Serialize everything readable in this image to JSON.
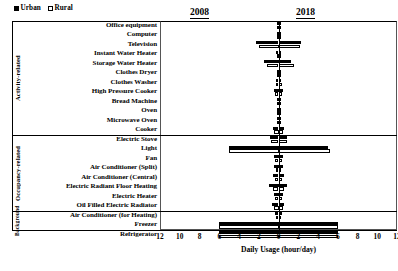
{
  "legend": {
    "items": [
      {
        "label": "Urban",
        "swatch": "filled-black",
        "color": "#000000"
      },
      {
        "label": "Rural",
        "swatch": "hollow-white",
        "color": "#ffffff"
      }
    ]
  },
  "headers": {
    "left_year": "2008",
    "right_year": "2018"
  },
  "groups": [
    {
      "name": "Activity-related",
      "rows": 12
    },
    {
      "name": "Occupancy-related",
      "rows": 8
    },
    {
      "name": "Background",
      "rows": 2
    }
  ],
  "axis": {
    "title": "Daily Usage (hour/day)",
    "ticks": [
      "12",
      "10",
      "8",
      "6",
      "4",
      "2",
      "0",
      "2",
      "4",
      "6",
      "8",
      "10",
      "12"
    ],
    "max": 12,
    "left_direction_year": "2008",
    "right_direction_year": "2018"
  },
  "chart_data": {
    "type": "bar",
    "title": "",
    "subtitle": "",
    "xlabel": "Daily Usage (hour/day)",
    "ylabel": "",
    "xlim": [
      -12,
      12
    ],
    "grid": false,
    "legend_position": "top-left",
    "orientation": "horizontal-diverging",
    "note": "Butterfly chart: left half shows 2008 values, right half shows 2018 values; each appliance has an Urban (filled) bar and a Rural (hollow) bar.",
    "categories": [
      "Office equipment",
      "Computer",
      "Television",
      "Instant Water Heater",
      "Storage Water Heater",
      "Clothes Dryer",
      "Clothes Washer",
      "High Pressure Cooker",
      "Bread Machine",
      "Oven",
      "Microwave Oven",
      "Cooker",
      "Electric Stove",
      "Light",
      "Fan",
      "Air Conditioner (Split)",
      "Air Conditioner (Central)",
      "Electric Radiant Floor Heating",
      "Electric Heater",
      "Oil Filled Electric Radiator",
      "Air Conditioner (for Heating)",
      "Freezer",
      "Refrigerator"
    ],
    "series": [
      {
        "name": "Urban 2008",
        "side": "left",
        "group": "Urban",
        "year": "2008",
        "values": [
          0.1,
          0.2,
          2.3,
          0.3,
          1.5,
          0.2,
          0.3,
          0.5,
          0.1,
          0.1,
          0.2,
          0.6,
          0.9,
          5.0,
          0.5,
          0.5,
          0.6,
          1.0,
          0.5,
          0.7,
          0.4,
          6.0,
          6.0
        ]
      },
      {
        "name": "Rural 2008",
        "side": "left",
        "group": "Rural",
        "year": "2008",
        "values": [
          0.1,
          0.2,
          2.0,
          0.2,
          1.2,
          0.2,
          0.3,
          0.4,
          0.1,
          0.1,
          0.2,
          0.5,
          0.8,
          5.0,
          0.4,
          0.3,
          0.4,
          0.6,
          0.4,
          0.5,
          0.3,
          6.0,
          6.0
        ]
      },
      {
        "name": "Urban 2018",
        "side": "right",
        "group": "Urban",
        "year": "2018",
        "values": [
          0.2,
          0.3,
          2.3,
          0.3,
          1.3,
          0.3,
          0.3,
          0.5,
          0.1,
          0.1,
          0.2,
          0.6,
          0.9,
          5.0,
          0.5,
          0.5,
          0.6,
          0.9,
          0.5,
          0.6,
          0.4,
          6.0,
          6.0
        ]
      },
      {
        "name": "Rural 2018",
        "side": "right",
        "group": "Rural",
        "year": "2018",
        "values": [
          0.2,
          0.3,
          2.2,
          0.2,
          1.6,
          0.3,
          0.4,
          0.4,
          0.1,
          0.1,
          0.2,
          0.5,
          0.9,
          5.2,
          0.4,
          0.3,
          0.4,
          0.6,
          0.4,
          0.5,
          0.3,
          6.0,
          6.0
        ]
      }
    ]
  }
}
